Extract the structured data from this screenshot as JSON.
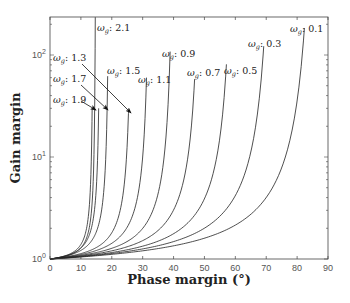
{
  "chart_data": {
    "type": "line",
    "title": "",
    "xlabel": "Phase margin (°)",
    "ylabel": "Gain margin",
    "xlim": [
      0,
      90
    ],
    "ylim": [
      1,
      235
    ],
    "yscale": "log",
    "grid": false,
    "legend": "inline labels",
    "x_ticks": [
      0,
      10,
      20,
      30,
      40,
      50,
      60,
      70,
      80,
      90
    ],
    "x_tick_labels": [
      "0",
      "10",
      "20",
      "30",
      "40",
      "50",
      "60",
      "70",
      "80",
      "90"
    ],
    "y_ticks": [
      1,
      10,
      100
    ],
    "y_tick_labels": [
      "10^0",
      "10^1",
      "10^2"
    ],
    "series": [
      {
        "name": "ωg: 2.1",
        "asymptote": 15.0,
        "k": 0.055,
        "pm_top": 14.0,
        "gm_top": 235
      },
      {
        "name": "ωg: 1.9",
        "asymptote": 14.2,
        "k": 0.06,
        "pm_top": 13.2,
        "gm_top": 30
      },
      {
        "name": "ωg: 1.7",
        "asymptote": 16.5,
        "k": 0.07,
        "pm_top": 15.6,
        "gm_top": 30
      },
      {
        "name": "ωg: 1.5",
        "asymptote": 19.5,
        "k": 0.08,
        "pm_top": 18.5,
        "gm_top": 62
      },
      {
        "name": "ωg: 1.3",
        "asymptote": 27.0,
        "k": 0.09,
        "pm_top": 26.3,
        "gm_top": 29
      },
      {
        "name": "ωg: 1.1",
        "asymptote": 33.0,
        "k": 0.1,
        "pm_top": 33.0,
        "gm_top": 60
      },
      {
        "name": "ωg: 0.9",
        "asymptote": 41.0,
        "k": 0.11,
        "pm_top": 39.8,
        "gm_top": 108
      },
      {
        "name": "ωg: 0.7",
        "asymptote": 50.0,
        "k": 0.12,
        "pm_top": 48.2,
        "gm_top": 58
      },
      {
        "name": "ωg: 0.5",
        "asymptote": 61.0,
        "k": 0.13,
        "pm_top": 57.9,
        "gm_top": 81
      },
      {
        "name": "ωg: 0.3",
        "asymptote": 74.0,
        "k": 0.145,
        "pm_top": 69.9,
        "gm_top": 122
      },
      {
        "name": "ωg: 0.1",
        "asymptote": 88.0,
        "k": 0.155,
        "pm_top": 82.8,
        "gm_top": 184
      }
    ],
    "annotations": [
      {
        "text": "ωg: 2.1",
        "x": 97,
        "y": 31
      },
      {
        "text": "ωg: 1.3",
        "x": 53,
        "y": 61,
        "arrow_to": [
          131,
          113
        ]
      },
      {
        "text": "ωg: 1.5",
        "x": 107,
        "y": 74
      },
      {
        "text": "ωg: 1.7",
        "x": 53,
        "y": 82,
        "arrow_to": [
          108,
          110
        ]
      },
      {
        "text": "ωg: 1.9",
        "x": 53,
        "y": 103,
        "arrow_to": [
          96,
          110
        ]
      },
      {
        "text": "ωg: 1.1",
        "x": 138,
        "y": 83
      },
      {
        "text": "ωg: 0.9",
        "x": 162,
        "y": 57
      },
      {
        "text": "ωg: 0.7",
        "x": 187,
        "y": 76
      },
      {
        "text": "ωg: 0.5",
        "x": 224,
        "y": 74
      },
      {
        "text": "ωg: 0.3",
        "x": 248,
        "y": 47
      },
      {
        "text": "ωg: 0.1",
        "x": 290,
        "y": 32
      }
    ]
  },
  "axes": {
    "xlabel": "Phase margin (°)",
    "ylabel": "Gain margin"
  }
}
